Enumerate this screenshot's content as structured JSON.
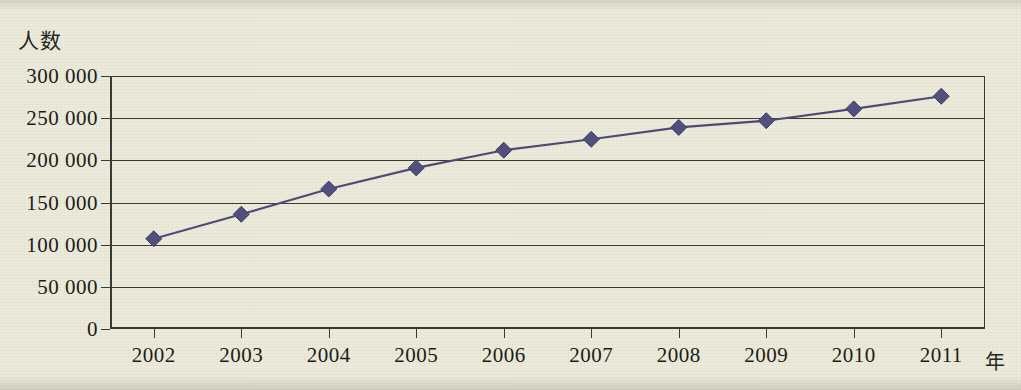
{
  "chart_data": {
    "type": "line",
    "title": "",
    "xlabel": "年",
    "ylabel": "人数",
    "x": [
      "2002",
      "2003",
      "2004",
      "2005",
      "2006",
      "2007",
      "2008",
      "2009",
      "2010",
      "2011"
    ],
    "categories": [
      "2002",
      "2003",
      "2004",
      "2005",
      "2006",
      "2007",
      "2008",
      "2009",
      "2010",
      "2011"
    ],
    "values": [
      107000,
      136000,
      166000,
      191000,
      212000,
      225000,
      239000,
      247000,
      261000,
      276000
    ],
    "series": [
      {
        "name": "人数",
        "values": [
          107000,
          136000,
          166000,
          191000,
          212000,
          225000,
          239000,
          247000,
          261000,
          276000
        ]
      }
    ],
    "ylim": [
      0,
      300000
    ],
    "ytick_values": [
      0,
      50000,
      100000,
      150000,
      200000,
      250000,
      300000
    ],
    "ytick_labels": [
      "0",
      "50 000",
      "100 000",
      "150 000",
      "200 000",
      "250 000",
      "300 000"
    ],
    "xtick_labels": [
      "2002",
      "2003",
      "2004",
      "2005",
      "2006",
      "2007",
      "2008",
      "2009",
      "2010",
      "2011"
    ],
    "grid": "horizontal",
    "legend": "none",
    "marker": "diamond",
    "colors": {
      "line": "#4b4b78",
      "marker": "#514f7d",
      "axis": "#3b3b31",
      "text": "#1d1d17",
      "background": "#eceadb"
    }
  },
  "axes": {
    "y_title": "人数",
    "x_title": "年"
  }
}
